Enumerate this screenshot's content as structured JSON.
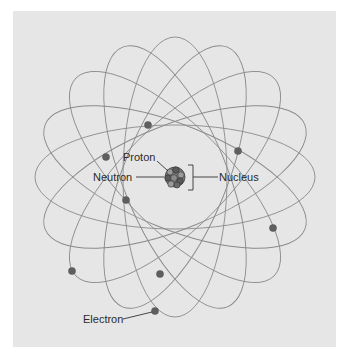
{
  "diagram": {
    "colors": {
      "background": "#ffffff",
      "panel": "#e6e6e6",
      "orbit": "#8a8a8a",
      "electron": "#5e5e5e",
      "nucleus": "#6a6a6a",
      "leader": "#333333",
      "text": "#2a2a2a"
    },
    "center": {
      "x": 175,
      "y": 177
    },
    "orbits": [
      {
        "rx": 140,
        "ry": 52,
        "rotation": 0
      },
      {
        "rx": 140,
        "ry": 52,
        "rotation": 22
      },
      {
        "rx": 140,
        "ry": 52,
        "rotation": 45
      },
      {
        "rx": 140,
        "ry": 52,
        "rotation": 68
      },
      {
        "rx": 140,
        "ry": 52,
        "rotation": 90
      },
      {
        "rx": 140,
        "ry": 52,
        "rotation": 112
      },
      {
        "rx": 140,
        "ry": 52,
        "rotation": 135
      },
      {
        "rx": 140,
        "ry": 52,
        "rotation": 158
      }
    ],
    "electrons": [
      {
        "x": 148,
        "y": 125
      },
      {
        "x": 106,
        "y": 157
      },
      {
        "x": 126,
        "y": 200
      },
      {
        "x": 238,
        "y": 151
      },
      {
        "x": 273,
        "y": 228
      },
      {
        "x": 72,
        "y": 271
      },
      {
        "x": 160,
        "y": 274
      },
      {
        "x": 155,
        "y": 311
      }
    ],
    "labels": {
      "proton": "Proton",
      "neutron": "Neutron",
      "nucleus": "Nucleus",
      "electron": "Electron"
    }
  }
}
